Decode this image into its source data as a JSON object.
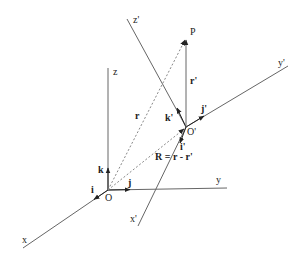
{
  "diagram": {
    "frame_unprimed": {
      "origin_label": "O",
      "axes": {
        "x": "x",
        "y": "y",
        "z": "z"
      },
      "unit_vectors": {
        "i": "i",
        "j": "j",
        "k": "k"
      }
    },
    "frame_primed": {
      "origin_label": "O'",
      "axes": {
        "x": "x'",
        "y": "y'",
        "z": "z'"
      },
      "unit_vectors": {
        "i": "i'",
        "j": "j'",
        "k": "k'"
      }
    },
    "point_label": "P",
    "vectors": {
      "r": "r",
      "r_prime": "r'",
      "R": "R = r - r'"
    },
    "colors": {
      "line": "#666666",
      "text": "#222222",
      "dashed": "#888888"
    }
  }
}
